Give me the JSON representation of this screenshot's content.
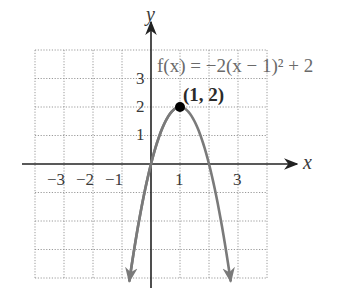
{
  "chart_data": {
    "type": "line",
    "title": "",
    "function_label": "f(x) = −2(x − 1)² + 2",
    "function_expression": "-2*(x-1)^2+2",
    "xlabel": "x",
    "ylabel": "y",
    "xlim": [
      -4,
      4
    ],
    "ylim": [
      -4,
      4
    ],
    "grid": true,
    "grid_style": "dotted",
    "x_tick_labels": [
      "−3",
      "−2",
      "−1",
      "1",
      "3"
    ],
    "x_tick_values": [
      -3,
      -2,
      -1,
      1,
      3
    ],
    "y_tick_labels": [
      "1",
      "2",
      "3"
    ],
    "y_tick_values": [
      1,
      2,
      3
    ],
    "series": [
      {
        "name": "f(x) = −2(x − 1)² + 2",
        "color": "#7a7a7a",
        "x": [
          -0.75,
          -0.5,
          0,
          0.5,
          1,
          1.5,
          2,
          2.5,
          2.75
        ],
        "y": [
          -4.125,
          -2.5,
          0,
          1.5,
          2,
          1.5,
          0,
          -2.5,
          -4.125
        ],
        "arrows_at_ends": true
      }
    ],
    "annotations": [
      {
        "label": "(1, 2)",
        "x": 1,
        "y": 2,
        "marker": "filled-circle",
        "color": "#000000"
      }
    ],
    "colors": {
      "axis": "#222222",
      "grid": "#9a9a9a",
      "curve": "#7a7a7a",
      "vertex": "#000000"
    }
  }
}
